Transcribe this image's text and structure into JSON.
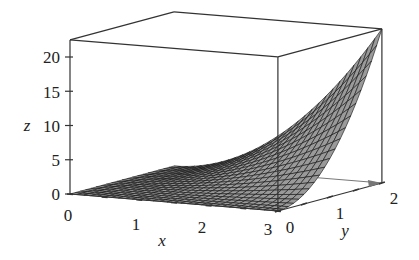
{
  "chart_data": {
    "type": "surface3d",
    "title": "",
    "function_estimate": "z ≈ 0.625 · x² · y²",
    "xlabel": "x",
    "ylabel": "y",
    "zlabel": "z",
    "x_range": [
      0,
      3
    ],
    "y_range": [
      0,
      2
    ],
    "zlim": [
      0,
      22.5
    ],
    "x_ticks": [
      0,
      1,
      2,
      3
    ],
    "y_ticks": [
      0,
      1,
      2
    ],
    "z_ticks": [
      0,
      5,
      10,
      15,
      20
    ],
    "mesh": {
      "nx": 30,
      "ny": 20
    },
    "grid": false,
    "box": true,
    "legend": null,
    "surface_corner_values": [
      {
        "x": 0,
        "y": 0,
        "z": 0
      },
      {
        "x": 3,
        "y": 0,
        "z": 0
      },
      {
        "x": 0,
        "y": 2,
        "z": 0
      },
      {
        "x": 3,
        "y": 2,
        "z": 22.5
      }
    ]
  },
  "labels": {
    "x_title": "x",
    "y_title": "y",
    "z_title": "z",
    "x_ticks": [
      "0",
      "1",
      "2",
      "3"
    ],
    "y_ticks": [
      "0",
      "1",
      "2"
    ],
    "z_ticks": [
      "0",
      "5",
      "10",
      "15",
      "20"
    ]
  },
  "colors": {
    "axis": "#333333",
    "mesh_line": "#111111",
    "surface_fill": "#9a9a9a",
    "arrow": "#777777"
  }
}
